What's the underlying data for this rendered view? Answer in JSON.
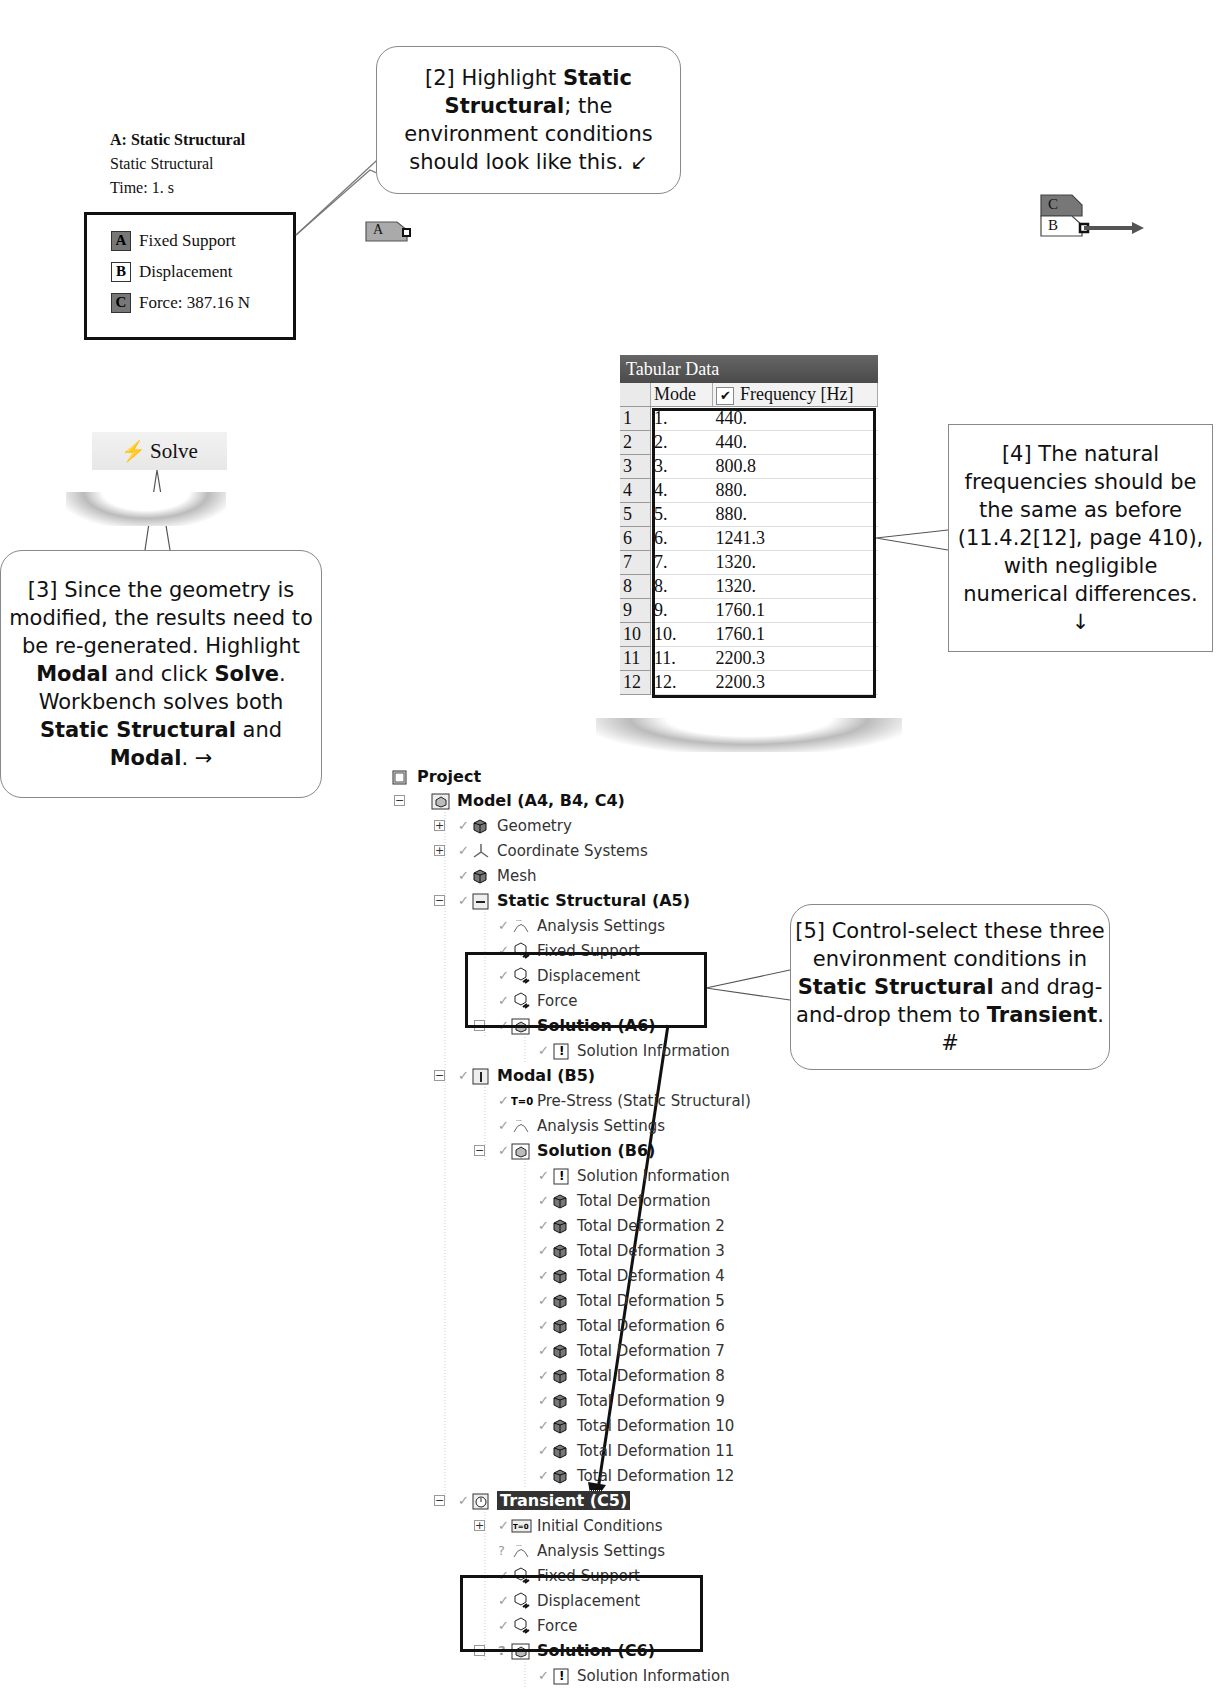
{
  "legend": {
    "title": "A: Static Structural",
    "subtitle": "Static Structural",
    "time": "Time: 1. s",
    "items": [
      {
        "tag": "A",
        "label": "Fixed Support",
        "style": "dark"
      },
      {
        "tag": "B",
        "label": "Displacement",
        "style": "light"
      },
      {
        "tag": "C",
        "label": "Force: 387.16 N",
        "style": "dark"
      }
    ]
  },
  "callouts": {
    "c2": {
      "prefix": "[2] Highlight ",
      "bold1": "Static Structural",
      "rest": "; the environment conditions should look like this. ↙"
    },
    "c3": {
      "p1": "[3] Since the geometry is modified, the results need to be re-generated.  Highlight ",
      "b1": "Modal",
      "p2": " and click ",
      "b2": "Solve",
      "p3": ". Workbench solves both ",
      "b3": "Static Structural",
      "p4": " and ",
      "b4": "Modal",
      "p5": ". →"
    },
    "c4": {
      "text": "[4] The natural frequencies should be the same as before (11.4.2[12], page 410), with negligible numerical differences. ↓"
    },
    "c5": {
      "p1": "[5] Control-select these three environment conditions in ",
      "b1": "Static Structural",
      "p2": " and drag-and-drop them to ",
      "b2": "Transient",
      "p3": ". #"
    }
  },
  "model_tags": {
    "tag_a": "A",
    "tag_c": "C",
    "tag_b": "B"
  },
  "solve_button": {
    "label": "Solve",
    "icon": "lightning-icon"
  },
  "tabular_data": {
    "title": "Tabular Data",
    "columns": [
      "Mode",
      "Frequency [Hz]"
    ],
    "frequency_checked": true,
    "rows": [
      {
        "n": "1",
        "mode": "1.",
        "freq": "440."
      },
      {
        "n": "2",
        "mode": "2.",
        "freq": "440."
      },
      {
        "n": "3",
        "mode": "3.",
        "freq": "800.8"
      },
      {
        "n": "4",
        "mode": "4.",
        "freq": "880."
      },
      {
        "n": "5",
        "mode": "5.",
        "freq": "880."
      },
      {
        "n": "6",
        "mode": "6.",
        "freq": "1241.3"
      },
      {
        "n": "7",
        "mode": "7.",
        "freq": "1320."
      },
      {
        "n": "8",
        "mode": "8.",
        "freq": "1320."
      },
      {
        "n": "9",
        "mode": "9.",
        "freq": "1760.1"
      },
      {
        "n": "10",
        "mode": "10.",
        "freq": "1760.1"
      },
      {
        "n": "11",
        "mode": "11.",
        "freq": "2200.3"
      },
      {
        "n": "12",
        "mode": "12.",
        "freq": "2200.3"
      }
    ]
  },
  "tree": {
    "nodes": [
      {
        "label": "Project",
        "bold": true,
        "x": 392,
        "y": 777,
        "icon": "project-icon"
      },
      {
        "label": "Model (A4, B4, C4)",
        "bold": true,
        "x": 432,
        "y": 801,
        "icon": "model-icon",
        "exp": "−"
      },
      {
        "label": "Geometry",
        "x": 472,
        "y": 826,
        "icon": "geometry-icon",
        "exp": "+",
        "check": true
      },
      {
        "label": "Coordinate Systems",
        "x": 472,
        "y": 851,
        "icon": "coordinate-systems-icon",
        "exp": "+",
        "check": true
      },
      {
        "label": "Mesh",
        "x": 472,
        "y": 876,
        "icon": "mesh-icon",
        "check": true
      },
      {
        "label": "Static Structural (A5)",
        "bold": true,
        "x": 472,
        "y": 901,
        "icon": "static-structural-icon",
        "exp": "−",
        "check": true
      },
      {
        "label": "Analysis Settings",
        "x": 512,
        "y": 926,
        "icon": "analysis-settings-icon",
        "check": true
      },
      {
        "label": "Fixed Support",
        "x": 512,
        "y": 951,
        "icon": "fixed-support-icon",
        "check": true
      },
      {
        "label": "Displacement",
        "x": 512,
        "y": 976,
        "icon": "displacement-icon",
        "check": true
      },
      {
        "label": "Force",
        "x": 512,
        "y": 1001,
        "icon": "force-icon",
        "check": true
      },
      {
        "label": "Solution (A6)",
        "bold": true,
        "x": 512,
        "y": 1026,
        "icon": "solution-icon",
        "exp": "−",
        "check": true
      },
      {
        "label": "Solution Information",
        "x": 552,
        "y": 1051,
        "icon": "solution-information-icon",
        "check": true
      },
      {
        "label": "Modal (B5)",
        "bold": true,
        "x": 472,
        "y": 1076,
        "icon": "modal-icon",
        "exp": "−",
        "check": true
      },
      {
        "label": "Pre-Stress (Static Structural)",
        "x": 512,
        "y": 1101,
        "icon": "pre-stress-icon",
        "check": true
      },
      {
        "label": "Analysis Settings",
        "x": 512,
        "y": 1126,
        "icon": "analysis-settings-icon",
        "check": true
      },
      {
        "label": "Solution (B6)",
        "bold": true,
        "x": 512,
        "y": 1151,
        "icon": "solution-icon",
        "exp": "−",
        "check": true
      },
      {
        "label": "Solution Information",
        "x": 552,
        "y": 1176,
        "icon": "solution-information-icon",
        "check": true
      },
      {
        "label": "Total Deformation",
        "x": 552,
        "y": 1201,
        "icon": "total-deformation-icon",
        "check": true
      },
      {
        "label": "Total Deformation 2",
        "x": 552,
        "y": 1226,
        "icon": "total-deformation-icon",
        "check": true
      },
      {
        "label": "Total Deformation 3",
        "x": 552,
        "y": 1251,
        "icon": "total-deformation-icon",
        "check": true
      },
      {
        "label": "Total Deformation 4",
        "x": 552,
        "y": 1276,
        "icon": "total-deformation-icon",
        "check": true
      },
      {
        "label": "Total Deformation 5",
        "x": 552,
        "y": 1301,
        "icon": "total-deformation-icon",
        "check": true
      },
      {
        "label": "Total Deformation 6",
        "x": 552,
        "y": 1326,
        "icon": "total-deformation-icon",
        "check": true
      },
      {
        "label": "Total Deformation 7",
        "x": 552,
        "y": 1351,
        "icon": "total-deformation-icon",
        "check": true
      },
      {
        "label": "Total Deformation 8",
        "x": 552,
        "y": 1376,
        "icon": "total-deformation-icon",
        "check": true
      },
      {
        "label": "Total Deformation 9",
        "x": 552,
        "y": 1401,
        "icon": "total-deformation-icon",
        "check": true
      },
      {
        "label": "Total Deformation 10",
        "x": 552,
        "y": 1426,
        "icon": "total-deformation-icon",
        "check": true
      },
      {
        "label": "Total Deformation 11",
        "x": 552,
        "y": 1451,
        "icon": "total-deformation-icon",
        "check": true
      },
      {
        "label": "Total Deformation 12",
        "x": 552,
        "y": 1476,
        "icon": "total-deformation-icon",
        "check": true
      },
      {
        "label": "Transient (C5)",
        "bold": true,
        "selected": true,
        "x": 472,
        "y": 1501,
        "icon": "transient-icon",
        "exp": "−",
        "check": true
      },
      {
        "label": "Initial Conditions",
        "x": 512,
        "y": 1526,
        "icon": "initial-conditions-icon",
        "exp": "+",
        "check": true
      },
      {
        "label": "Analysis Settings",
        "x": 512,
        "y": 1551,
        "icon": "analysis-settings-icon",
        "question": true
      },
      {
        "label": "Fixed Support",
        "x": 512,
        "y": 1576,
        "icon": "fixed-support-icon",
        "check": true
      },
      {
        "label": "Displacement",
        "x": 512,
        "y": 1601,
        "icon": "displacement-icon",
        "check": true
      },
      {
        "label": "Force",
        "x": 512,
        "y": 1626,
        "icon": "force-icon",
        "check": true
      },
      {
        "label": "Solution (C6)",
        "bold": true,
        "x": 512,
        "y": 1651,
        "icon": "solution-icon",
        "exp": "−",
        "question": true
      },
      {
        "label": "Solution Information",
        "x": 552,
        "y": 1676,
        "icon": "solution-information-icon",
        "check": true
      }
    ]
  }
}
